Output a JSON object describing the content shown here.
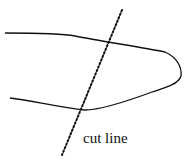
{
  "diagram": {
    "label": "cut line",
    "elements": [
      {
        "type": "outline",
        "description": "elongated rounded shape, open on left"
      },
      {
        "type": "dotted-line",
        "description": "diagonal cut line crossing the shape"
      }
    ]
  }
}
